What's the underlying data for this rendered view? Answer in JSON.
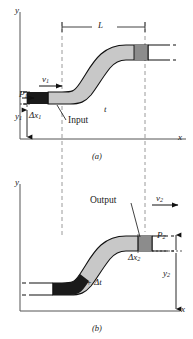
{
  "figure": {
    "type": "fluid-flow-bernoulli-diagram",
    "panels": [
      {
        "id": "a",
        "caption": "(a)",
        "axis_y": "y",
        "axis_x": "x",
        "labels": {
          "length": "L",
          "velocity": "v",
          "velocity_sub": "1",
          "pressure": "P",
          "pressure_sub": "1",
          "height": "y",
          "height_sub": "1",
          "delta_x": "Δx",
          "delta_x_sub": "1",
          "time": "t",
          "port": "Input"
        }
      },
      {
        "id": "b",
        "caption": "(b)",
        "axis_y": "y",
        "axis_x": "x",
        "labels": {
          "velocity": "v",
          "velocity_sub": "2",
          "pressure": "P",
          "pressure_sub": "2",
          "height": "y",
          "height_sub": "2",
          "delta_x": "Δx",
          "delta_x_sub": "2",
          "time": "t + Δt",
          "port": "Output"
        }
      }
    ],
    "colors": {
      "fluid_fill": "#c8c8c8",
      "plug_dark": "#1a1a1a",
      "plug_gray": "#8c8c8c",
      "outline": "#111111",
      "axis": "#555555",
      "dashed_guide": "#9a9a9a"
    }
  }
}
